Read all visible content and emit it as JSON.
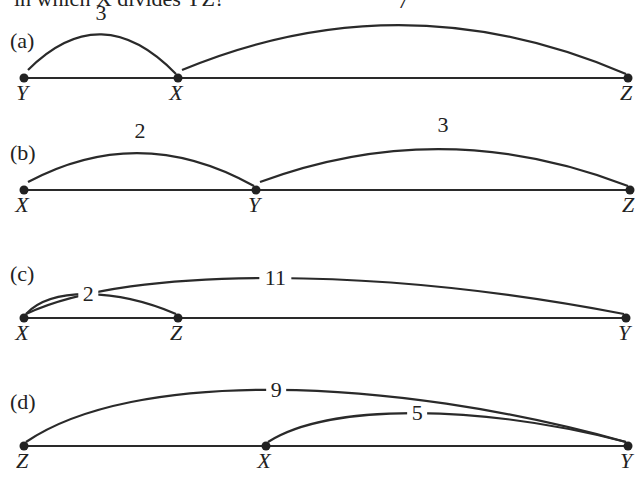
{
  "header_text": "in which X divides YZ?",
  "panels": [
    {
      "label": "(a)",
      "points": [
        {
          "name": "Y",
          "pos": 0
        },
        {
          "name": "X",
          "pos": 3
        },
        {
          "name": "Z",
          "pos": 10
        }
      ],
      "arcs": [
        {
          "from": "Y",
          "to": "X",
          "label": "3",
          "style": "over"
        },
        {
          "from": "X",
          "to": "Z",
          "label": "7",
          "style": "over"
        }
      ]
    },
    {
      "label": "(b)",
      "points": [
        {
          "name": "X",
          "pos": 0
        },
        {
          "name": "Y",
          "pos": 2
        },
        {
          "name": "Z",
          "pos": 5
        }
      ],
      "arcs": [
        {
          "from": "X",
          "to": "Y",
          "label": "2",
          "style": "over"
        },
        {
          "from": "Y",
          "to": "Z",
          "label": "3",
          "style": "over"
        }
      ]
    },
    {
      "label": "(c)",
      "points": [
        {
          "name": "X",
          "pos": 0
        },
        {
          "name": "Z",
          "pos": 2
        },
        {
          "name": "Y",
          "pos": 11
        }
      ],
      "arcs": [
        {
          "from": "X",
          "to": "Y",
          "label": "11",
          "style": "inline"
        },
        {
          "from": "X",
          "to": "Z",
          "label": "2",
          "style": "inline"
        }
      ]
    },
    {
      "label": "(d)",
      "points": [
        {
          "name": "Z",
          "pos": 0
        },
        {
          "name": "X",
          "pos": 4
        },
        {
          "name": "Y",
          "pos": 9
        }
      ],
      "arcs": [
        {
          "from": "Z",
          "to": "Y",
          "label": "9",
          "style": "inline"
        },
        {
          "from": "X",
          "to": "Y",
          "label": "5",
          "style": "inline"
        }
      ]
    }
  ]
}
